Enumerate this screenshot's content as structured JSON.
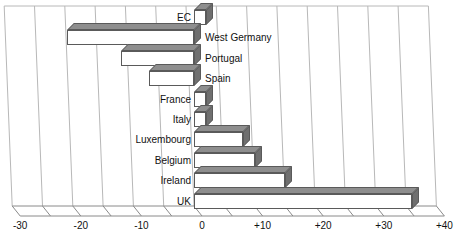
{
  "chart_data": {
    "type": "bar",
    "orientation": "horizontal",
    "title": "",
    "subtitle": "",
    "xlabel": "",
    "ylabel": "",
    "xlim": [
      -30,
      40
    ],
    "grid": true,
    "legend": null,
    "style": "3d-bar",
    "categories": [
      "EC",
      "West Germany",
      "Portugal",
      "Spain",
      "France",
      "Italy",
      "Luxembourg",
      "Belgium",
      "Ireland",
      "UK"
    ],
    "values": [
      2,
      -21,
      -12,
      -7.5,
      2,
      2,
      8,
      10,
      15,
      36
    ],
    "tick_labels": [
      "-30",
      "-20",
      "-10",
      "0",
      "+10",
      "+20",
      "+30",
      "+40"
    ],
    "tick_values": [
      -30,
      -20,
      -10,
      0,
      10,
      20,
      30,
      40
    ],
    "minor_tick_interval": 5,
    "bar_face_color": "#ffffff",
    "bar_top_color": "#8e8e8e",
    "bar_side_color": "#6f6f6f",
    "bar_edge_color": "#5a5a5a",
    "grid_color": "#b8b8b8",
    "axis_color": "#8a8a8a",
    "label_color": "#111111",
    "points": [
      {
        "label": "EC",
        "value": 2,
        "label_side": "left"
      },
      {
        "label": "West Germany",
        "value": -21,
        "label_side": "right"
      },
      {
        "label": "Portugal",
        "value": -12,
        "label_side": "right"
      },
      {
        "label": "Spain",
        "value": -7.5,
        "label_side": "right"
      },
      {
        "label": "France",
        "value": 2,
        "label_side": "left"
      },
      {
        "label": "Italy",
        "value": 2,
        "label_side": "left"
      },
      {
        "label": "Luxembourg",
        "value": 8,
        "label_side": "left"
      },
      {
        "label": "Belgium",
        "value": 10,
        "label_side": "left"
      },
      {
        "label": "Ireland",
        "value": 15,
        "label_side": "left"
      },
      {
        "label": "UK",
        "value": 36,
        "label_side": "left"
      }
    ]
  }
}
